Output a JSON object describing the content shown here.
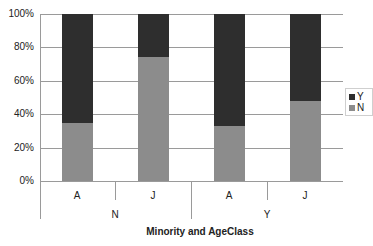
{
  "chart_data": {
    "type": "bar",
    "stacked": "percent",
    "title": "",
    "xlabel": "Minority and AgeClass",
    "ylabel": "",
    "ylim": [
      0,
      100
    ],
    "y_ticks": [
      "0%",
      "20%",
      "40%",
      "60%",
      "80%",
      "100%"
    ],
    "grid": true,
    "legend_position": "right",
    "groups": [
      "N",
      "Y"
    ],
    "categories": [
      "A",
      "J",
      "A",
      "J"
    ],
    "category_groups": [
      "N",
      "N",
      "Y",
      "Y"
    ],
    "series": [
      {
        "name": "N",
        "color": "#8c8c8c",
        "values": [
          35,
          74,
          33,
          48
        ]
      },
      {
        "name": "Y",
        "color": "#2e2e2e",
        "values": [
          65,
          26,
          67,
          52
        ]
      }
    ]
  },
  "legend": {
    "items": [
      {
        "label": "Y",
        "color": "#2e2e2e"
      },
      {
        "label": "N",
        "color": "#8c8c8c"
      }
    ]
  }
}
